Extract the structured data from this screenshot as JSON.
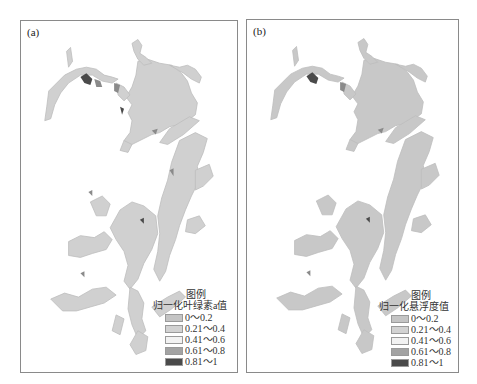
{
  "figure": {
    "panels": [
      {
        "id": "a",
        "label": "(a)",
        "legend": {
          "title": "图例",
          "subtitle": "归一化叶绿素a值",
          "classes": [
            {
              "range": "0～0.2",
              "color": "#c4c4c4"
            },
            {
              "range": "0.21～0.4",
              "color": "#d2d2d2"
            },
            {
              "range": "0.41～0.6",
              "color": "#f2f2f2"
            },
            {
              "range": "0.61～0.8",
              "color": "#a3a3a3"
            },
            {
              "range": "0.81～1",
              "color": "#4a4a4a"
            }
          ]
        }
      },
      {
        "id": "b",
        "label": "(b)",
        "legend": {
          "title": "图例",
          "subtitle": "归一化悬浮度值",
          "classes": [
            {
              "range": "0～0.2",
              "color": "#c4c4c4"
            },
            {
              "range": "0.21～0.4",
              "color": "#d2d2d2"
            },
            {
              "range": "0.41～0.6",
              "color": "#f2f2f2"
            },
            {
              "range": "0.61～0.8",
              "color": "#a3a3a3"
            },
            {
              "range": "0.81～1",
              "color": "#4a4a4a"
            }
          ]
        }
      }
    ]
  }
}
